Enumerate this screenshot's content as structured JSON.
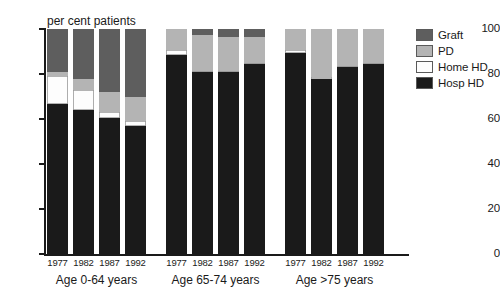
{
  "chart_data": {
    "type": "bar",
    "subtype": "stacked-bar-grouped",
    "title": "per cent patients",
    "xlabel": "",
    "ylabel": "per cent patients",
    "ylim": [
      0,
      100
    ],
    "yticks": [
      0,
      20,
      40,
      60,
      80,
      100
    ],
    "ytick_labels": [
      "0",
      "20",
      "40",
      "60",
      "80",
      "100"
    ],
    "grid": false,
    "legend_position": "right",
    "stack_order_bottom_to_top": [
      "Hosp HD",
      "Home HD",
      "PD",
      "Graft"
    ],
    "series": [
      {
        "name": "Hosp HD",
        "color": "#1a1a1a",
        "values": [
          66.5,
          64.0,
          60.5,
          57.0,
          88.5,
          81.0,
          81.0,
          84.5,
          89.5,
          78.0,
          83.0,
          84.5
        ]
      },
      {
        "name": "Home HD",
        "color": "#fdfdfd",
        "values": [
          12.5,
          9.0,
          2.5,
          2.0,
          2.0,
          0.5,
          0.5,
          0.5,
          1.0,
          0.5,
          0.5,
          0.5
        ]
      },
      {
        "name": "PD",
        "color": "#b4b4b4",
        "values": [
          2.0,
          5.0,
          9.0,
          11.0,
          9.5,
          16.0,
          15.0,
          11.5,
          9.5,
          21.5,
          16.5,
          15.0
        ]
      },
      {
        "name": "Graft",
        "color": "#5e5e5e",
        "values": [
          19.0,
          22.0,
          28.0,
          30.0,
          0.0,
          2.5,
          3.5,
          3.5,
          0.0,
          0.0,
          0.0,
          0.0
        ]
      }
    ],
    "groups": [
      {
        "label": "Age 0-64 years",
        "categories": [
          "1977",
          "1982",
          "1987",
          "1992"
        ],
        "bars": [
          {
            "category": "1977",
            "Hosp HD": 66.5,
            "Home HD": 12.5,
            "PD": 2.0,
            "Graft": 19.0
          },
          {
            "category": "1982",
            "Hosp HD": 64.0,
            "Home HD": 9.0,
            "PD": 5.0,
            "Graft": 22.0
          },
          {
            "category": "1987",
            "Hosp HD": 60.5,
            "Home HD": 2.5,
            "PD": 9.0,
            "Graft": 28.0
          },
          {
            "category": "1992",
            "Hosp HD": 57.0,
            "Home HD": 2.0,
            "PD": 11.0,
            "Graft": 30.0
          }
        ]
      },
      {
        "label": "Age 65-74 years",
        "categories": [
          "1977",
          "1982",
          "1987",
          "1992"
        ],
        "bars": [
          {
            "category": "1977",
            "Hosp HD": 88.5,
            "Home HD": 2.0,
            "PD": 9.5,
            "Graft": 0.0
          },
          {
            "category": "1982",
            "Hosp HD": 81.0,
            "Home HD": 0.5,
            "PD": 16.0,
            "Graft": 2.5
          },
          {
            "category": "1987",
            "Hosp HD": 81.0,
            "Home HD": 0.5,
            "PD": 15.0,
            "Graft": 3.5
          },
          {
            "category": "1992",
            "Hosp HD": 84.5,
            "Home HD": 0.5,
            "PD": 11.5,
            "Graft": 3.5
          }
        ]
      },
      {
        "label": "Age >75 years",
        "categories": [
          "1977",
          "1982",
          "1987",
          "1992"
        ],
        "bars": [
          {
            "category": "1977",
            "Hosp HD": 89.5,
            "Home HD": 1.0,
            "PD": 9.5,
            "Graft": 0.0
          },
          {
            "category": "1982",
            "Hosp HD": 78.0,
            "Home HD": 0.5,
            "PD": 21.5,
            "Graft": 0.0
          },
          {
            "category": "1987",
            "Hosp HD": 83.0,
            "Home HD": 0.5,
            "PD": 16.5,
            "Graft": 0.0
          },
          {
            "category": "1992",
            "Hosp HD": 84.5,
            "Home HD": 0.5,
            "PD": 15.0,
            "Graft": 0.0
          }
        ]
      }
    ],
    "legend": [
      {
        "label": "Graft",
        "color": "#5e5e5e"
      },
      {
        "label": "PD",
        "color": "#b4b4b4"
      },
      {
        "label": "Home HD",
        "color": "#fdfdfd"
      },
      {
        "label": "Hosp HD",
        "color": "#1a1a1a"
      }
    ]
  },
  "colors": {
    "graft": "#5e5e5e",
    "pd": "#b4b4b4",
    "home_hd": "#fdfdfd",
    "hosp_hd": "#1a1a1a",
    "axis": "#1a1a1a",
    "background": "#ffffff"
  }
}
